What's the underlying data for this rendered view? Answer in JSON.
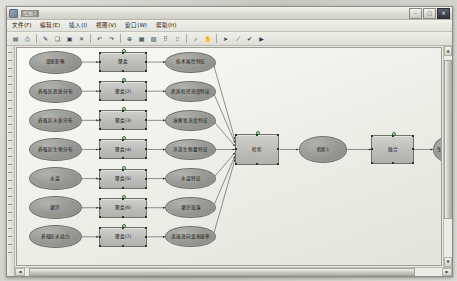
{
  "window": {
    "title": "绘图1",
    "buttons": {
      "minimize": "–",
      "maximize": "□",
      "close": "✕"
    }
  },
  "menubar": {
    "items": [
      {
        "label": "文件(F)"
      },
      {
        "label": "编辑(E)"
      },
      {
        "label": "插入(I)"
      },
      {
        "label": "视图(V)"
      },
      {
        "label": "窗口(W)"
      },
      {
        "label": "帮助(H)"
      }
    ]
  },
  "toolbar": {
    "buttons": [
      {
        "name": "save-icon",
        "glyph": "▤"
      },
      {
        "name": "print-icon",
        "glyph": "⎙"
      },
      {
        "name": "format-paint-icon",
        "glyph": "✎"
      },
      {
        "name": "copy-icon",
        "glyph": "❏"
      },
      {
        "name": "paste-icon",
        "glyph": "▣"
      },
      {
        "name": "delete-icon",
        "glyph": "✕"
      },
      {
        "name": "undo-icon",
        "glyph": "↶"
      },
      {
        "name": "redo-icon",
        "glyph": "↷"
      },
      {
        "name": "link-icon",
        "glyph": "⊕"
      },
      {
        "name": "grid-icon",
        "glyph": "▦"
      },
      {
        "name": "layer-icon",
        "glyph": "▧"
      },
      {
        "name": "align-icon",
        "glyph": "⠿"
      },
      {
        "name": "distribute-icon",
        "glyph": "⁝⁝"
      },
      {
        "name": "zoom-icon",
        "glyph": "⌕"
      },
      {
        "name": "pan-icon",
        "glyph": "✋"
      },
      {
        "name": "pointer-icon",
        "glyph": "➤"
      },
      {
        "name": "connector-icon",
        "glyph": "⟋"
      },
      {
        "name": "check-icon",
        "glyph": "✔"
      },
      {
        "name": "run-icon",
        "glyph": "▶"
      }
    ]
  },
  "scrollbars": {
    "up_arrow": "▲",
    "down_arrow": "▼",
    "left_arrow": "◀",
    "right_arrow": "▶"
  },
  "diagram": {
    "sources": [
      {
        "id": "s1",
        "label": "遥感影像"
      },
      {
        "id": "s2",
        "label": "养殖区底质分布"
      },
      {
        "id": "s3",
        "label": "养殖区水质分布"
      },
      {
        "id": "s4",
        "label": "养殖区生物分布"
      },
      {
        "id": "s5",
        "label": "水温"
      },
      {
        "id": "s6",
        "label": "潮汐"
      },
      {
        "id": "s7",
        "label": "养殖区水动力"
      }
    ],
    "clusters": [
      {
        "id": "c1",
        "label": "聚类"
      },
      {
        "id": "c2",
        "label": "聚类(2)"
      },
      {
        "id": "c3",
        "label": "聚类(3)"
      },
      {
        "id": "c4",
        "label": "聚类(4)"
      },
      {
        "id": "c5",
        "label": "聚类(5)"
      },
      {
        "id": "c6",
        "label": "聚类(6)"
      },
      {
        "id": "c7",
        "label": "聚类(7)"
      }
    ],
    "features": [
      {
        "id": "f1",
        "label": "技术属性特征"
      },
      {
        "id": "f2",
        "label": "底质粒径浓度特征"
      },
      {
        "id": "f3",
        "label": "溶解氧浓度特征"
      },
      {
        "id": "f4",
        "label": "浮游生物量特征"
      },
      {
        "id": "f5",
        "label": "水温特征"
      },
      {
        "id": "f6",
        "label": "潮汐涨落"
      },
      {
        "id": "f7",
        "label": "流速流向变化速率"
      }
    ],
    "retrieve": {
      "id": "r1",
      "label": "检索"
    },
    "retrieve_result": {
      "id": "r2",
      "label": "检索1"
    },
    "fusion": {
      "id": "fu",
      "label": "融合"
    },
    "output": {
      "id": "out",
      "label": "生态养殖区流动模型"
    }
  }
}
